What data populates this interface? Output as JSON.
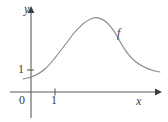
{
  "figure": {
    "kind": "math-function-graph",
    "background_color": "#ffffff",
    "width": 168,
    "height": 122
  },
  "axes": {
    "x_axis_label": "x",
    "y_axis_label": "y",
    "origin_label": "0",
    "axis_color": "#5b5b5b",
    "arrowhead_color": "#3d3d3d",
    "x_ticks": [
      {
        "label": "1",
        "value": 1
      }
    ],
    "y_ticks": [
      {
        "label": "1",
        "value": 1
      }
    ]
  },
  "curve": {
    "label": "f",
    "color": "#8a8a8a",
    "stroke_width": 1.15,
    "path": "M 23 79 C 31 78, 38 75, 45 69 C 53 62, 60 51, 68 41 C 75 31, 84 21, 93 18 C 102 16, 110 24, 117 36 C 123 47, 128 56, 136 62 C 144 68, 152 71, 160 72"
  },
  "chart_data": {
    "type": "line",
    "title": "",
    "xlabel": "x",
    "ylabel": "y",
    "legend": [
      "f"
    ],
    "grid": false,
    "xlim": [
      -0.33,
      5.38
    ],
    "ylim": [
      0,
      3.36
    ],
    "series": [
      {
        "name": "f",
        "x": [
          -0.33,
          0.0,
          0.58,
          1.0,
          1.5,
          2.08,
          2.58,
          3.08,
          3.58,
          4.08,
          4.58,
          5.0,
          5.38
        ],
        "y": [
          0.59,
          0.62,
          0.77,
          0.95,
          1.34,
          1.84,
          2.34,
          2.65,
          2.5,
          2.03,
          1.54,
          1.28,
          1.13
        ]
      }
    ],
    "annotations": [
      {
        "text": "f",
        "x": 4.05,
        "y": 2.43
      },
      {
        "text": "0",
        "x": -0.25,
        "y": -0.26
      },
      {
        "text": "1",
        "x": -0.3,
        "y": 1.0
      },
      {
        "text": "1",
        "x": 1.0,
        "y": -0.26
      }
    ]
  }
}
